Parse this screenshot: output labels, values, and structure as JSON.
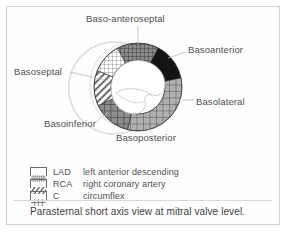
{
  "figure": {
    "caption": "Parasternal short axis view at mitral valve level.",
    "frame_color": "#d0d0d0"
  },
  "diagram": {
    "title": "Parasternal short axis view at mitral valve level",
    "type": "segmented-ring",
    "center": {
      "x": 138,
      "y": 87
    },
    "outer_radius": 44,
    "inner_radius": 27,
    "rv_outline_color": "#d8d8d8",
    "leader_line_color": "#b5b5b5",
    "segments": [
      {
        "name": "Baso-anteroseptal",
        "label": "Baso-anteroseptal",
        "territory": "LAD",
        "pattern": "fine-crosshatch",
        "fill": "#8f8f8f",
        "start_angle": -62,
        "end_angle": -12
      },
      {
        "name": "Basoanterior",
        "label": "Basoanterior",
        "territory": "LAD",
        "pattern": "solid-dark",
        "fill": "#141414",
        "start_angle": -12,
        "end_angle": 42
      },
      {
        "name": "Basolateral",
        "label": "Basolateral",
        "territory": "C",
        "pattern": "coarse-grid",
        "fill": "#a6a6a6",
        "start_angle": 42,
        "end_angle": 104
      },
      {
        "name": "Basoposterior",
        "label": "Basoposterior",
        "territory": "C",
        "pattern": "coarse-grid",
        "fill": "#828282",
        "start_angle": 104,
        "end_angle": 155
      },
      {
        "name": "Basoinferior",
        "label": "Basoinferior",
        "territory": "RCA",
        "pattern": "diagonal-stripes",
        "fill": "#c8c8c8",
        "start_angle": 155,
        "end_angle": 208
      },
      {
        "name": "Basoseptal",
        "label": "Basoseptal",
        "territory": "LAD",
        "pattern": "fine-crosshatch",
        "fill": "#d2d2d2",
        "start_angle": 208,
        "end_angle": 298
      }
    ]
  },
  "legend": {
    "rows": [
      {
        "pattern": "fine-crosshatch",
        "abbr": "LAD",
        "description": "left anterior descending"
      },
      {
        "pattern": "diagonal-stripes",
        "abbr": "RCA",
        "description": "right coronary artery"
      },
      {
        "pattern": "coarse-grid",
        "abbr": "C",
        "description": "circumflex"
      }
    ]
  }
}
